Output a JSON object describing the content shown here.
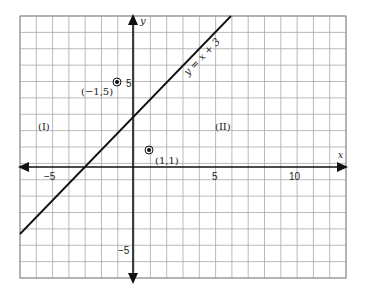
{
  "figure": {
    "axes": {
      "x_label": "x",
      "y_label": "y",
      "x_ticks": [
        {
          "value": -5,
          "label": "−5"
        },
        {
          "value": 5,
          "label": "5"
        },
        {
          "value": 10,
          "label": "10"
        }
      ],
      "y_ticks": [
        {
          "value": 5,
          "label": "5"
        },
        {
          "value": -5,
          "label": "−5"
        }
      ],
      "grid": {
        "x_min": -7,
        "x_max": 13,
        "y_min": -7,
        "y_max": 9
      }
    },
    "line": {
      "equation_label": "y = x + 3",
      "slope": 1,
      "intercept": 3
    },
    "points": [
      {
        "x": -1,
        "y": 5,
        "label": "(−1,5)"
      },
      {
        "x": 1,
        "y": 1,
        "label": "(1,1)"
      }
    ],
    "regions": [
      {
        "label": "(I)"
      },
      {
        "label": "(II)"
      }
    ],
    "colors": {
      "grid": "#9a9a9a",
      "axis": "#111111",
      "line": "#111111",
      "text": "#222222"
    }
  }
}
